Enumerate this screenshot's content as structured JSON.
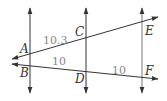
{
  "diagram": {
    "colors": {
      "line": "#333333",
      "label": "#333333",
      "measure": "#888888",
      "background": "#ffffff"
    },
    "points": {
      "A": "A",
      "B": "B",
      "C": "C",
      "D": "D",
      "E": "E",
      "F": "F"
    },
    "measures": {
      "AC": "10.3",
      "BD": "10",
      "DF": "10"
    },
    "parallel_lines": [
      {
        "name": "line-ab",
        "x": 30
      },
      {
        "name": "line-cd",
        "x": 86
      },
      {
        "name": "line-ef",
        "x": 142
      }
    ],
    "transversals": [
      {
        "name": "transversal-ace",
        "through": [
          "A",
          "C",
          "E"
        ]
      },
      {
        "name": "transversal-bdf",
        "through": [
          "B",
          "D",
          "F"
        ]
      }
    ]
  }
}
